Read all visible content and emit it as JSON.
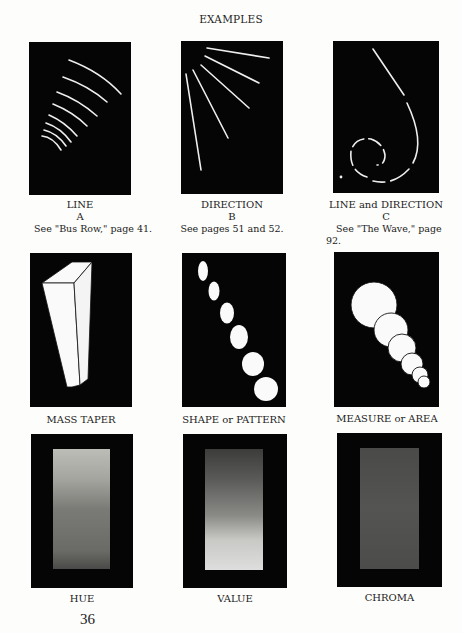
{
  "page": {
    "heading": "EXAMPLES",
    "page_number": "36"
  },
  "examples": [
    {
      "title": "LINE",
      "letter": "A",
      "reference": "See \"Bus Row,\" page 41.",
      "illustration": "concentric-arcs"
    },
    {
      "title": "DIRECTION",
      "letter": "B",
      "reference": "See pages 51 and 52.",
      "illustration": "radiating-lines"
    },
    {
      "title": "LINE and DIRECTION",
      "letter": "C",
      "reference": "See \"The Wave,\" page 92.",
      "illustration": "spiral-wave"
    },
    {
      "title": "MASS TAPER",
      "illustration": "tapered-block"
    },
    {
      "title": "SHAPE or PATTERN",
      "illustration": "ellipse-sequence"
    },
    {
      "title": "MEASURE or AREA",
      "illustration": "overlapping-circles"
    },
    {
      "title": "HUE",
      "illustration": "hue-gradient-swatch"
    },
    {
      "title": "VALUE",
      "illustration": "value-gradient-swatch"
    },
    {
      "title": "CHROMA",
      "illustration": "chroma-swatch"
    }
  ],
  "colors": {
    "panel": "#050505",
    "stroke": "#f2f2f2"
  }
}
